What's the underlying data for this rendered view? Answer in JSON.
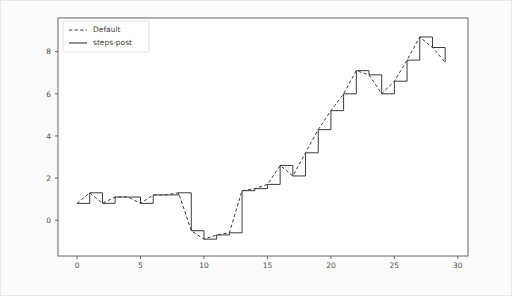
{
  "figure": {
    "background_color": "#fbfbfb",
    "axes_background_color": "#ffffff",
    "axes_edge_color": "#555555",
    "line_color": "#3a3a3a"
  },
  "legend": {
    "position": "upper-left",
    "entries": [
      {
        "label": "Default",
        "style": "dashed",
        "name": "legend-entry-default"
      },
      {
        "label": "steps-post",
        "style": "solid",
        "name": "legend-entry-steps-post"
      }
    ]
  },
  "axes": {
    "x": {
      "label": "",
      "ticks": [
        0,
        5,
        10,
        15,
        20,
        25,
        30
      ],
      "tick_labels": [
        "0",
        "5",
        "10",
        "15",
        "20",
        "25",
        "30"
      ],
      "min": -1.5,
      "max": 30.8
    },
    "y": {
      "label": "",
      "ticks": [
        0,
        2,
        4,
        6,
        8
      ],
      "tick_labels": [
        "0",
        "2",
        "4",
        "6",
        "8"
      ],
      "min": -1.7,
      "max": 9.6
    }
  },
  "chart_data": {
    "type": "line",
    "title": "",
    "xlabel": "",
    "ylabel": "",
    "xlim": [
      -1.5,
      30.8
    ],
    "ylim": [
      -1.7,
      9.6
    ],
    "grid": false,
    "legend_position": "upper left",
    "x": [
      0,
      1,
      2,
      3,
      4,
      5,
      6,
      7,
      8,
      9,
      10,
      11,
      12,
      13,
      14,
      15,
      16,
      17,
      18,
      19,
      20,
      21,
      22,
      23,
      24,
      25,
      26,
      27,
      28,
      29
    ],
    "series": [
      {
        "name": "Default",
        "drawstyle": "default",
        "linestyle": "dashed",
        "values": [
          0.8,
          1.3,
          0.8,
          1.1,
          1.1,
          0.8,
          1.2,
          1.2,
          1.3,
          -0.5,
          -0.9,
          -0.7,
          -0.6,
          1.4,
          1.5,
          1.7,
          2.6,
          2.1,
          3.2,
          4.3,
          5.2,
          6.0,
          7.1,
          6.9,
          6.0,
          6.6,
          7.6,
          8.7,
          8.2,
          7.5
        ]
      },
      {
        "name": "steps-post",
        "drawstyle": "steps-post",
        "linestyle": "solid",
        "values": [
          0.8,
          1.3,
          0.8,
          1.1,
          1.1,
          0.8,
          1.2,
          1.2,
          1.3,
          -0.5,
          -0.9,
          -0.7,
          -0.6,
          1.4,
          1.5,
          1.7,
          2.6,
          2.1,
          3.2,
          4.3,
          5.2,
          6.0,
          7.1,
          6.9,
          6.0,
          6.6,
          7.6,
          8.7,
          8.2,
          7.5
        ]
      }
    ]
  }
}
